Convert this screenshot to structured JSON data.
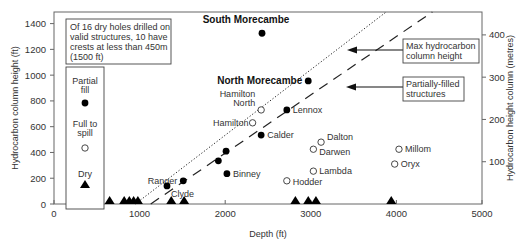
{
  "chart_data": {
    "type": "scatter",
    "title": "",
    "xlabel": "Depth (ft)",
    "ylabel": "Hydrocarbon column height (ft)",
    "ylabel_right": "Hydrocarbon height column (metres)",
    "xlim": [
      0,
      5000
    ],
    "ylim": [
      0,
      1490
    ],
    "x_ticks": [
      0,
      1000,
      2000,
      3000,
      4000,
      5000
    ],
    "y_ticks": [
      0,
      200,
      400,
      600,
      800,
      1000,
      1200,
      1400
    ],
    "y_ticks_right_m": [
      100,
      200,
      300,
      400
    ],
    "grid": false,
    "legend": {
      "position": "left-inset",
      "entries": [
        {
          "label_line1": "Partial",
          "label_line2": "fill",
          "marker": "filled-circle"
        },
        {
          "label_line1": "Full to",
          "label_line2": "spill",
          "marker": "open-circle"
        },
        {
          "label_line1": "Dry",
          "label_line2": "",
          "marker": "filled-triangle"
        }
      ]
    },
    "note_box": {
      "lines": [
        "Of 16 dry holes drilled on",
        "valid structures, 10 have",
        "crests at less than 450m",
        "(1500 ft)"
      ]
    },
    "annotations": [
      {
        "text_line1": "Max hydrocarbon",
        "text_line2": "column height",
        "points_to": "dotted-line"
      },
      {
        "text_line1": "Partially-filled",
        "text_line2": "structures",
        "points_to": "dashed-line"
      }
    ],
    "series": [
      {
        "name": "Partial fill",
        "marker": "filled-circle",
        "points": [
          {
            "label": "South Morecambe",
            "x": 2430,
            "y": 1325,
            "bold": true
          },
          {
            "label": "North Morecambe",
            "x": 2970,
            "y": 955,
            "bold": true
          },
          {
            "label": "Lennox",
            "x": 2720,
            "y": 730
          },
          {
            "label": "Calder",
            "x": 2420,
            "y": 535
          },
          {
            "label": "",
            "x": 2010,
            "y": 410
          },
          {
            "label": "",
            "x": 1920,
            "y": 335
          },
          {
            "label": "Binney",
            "x": 2020,
            "y": 235
          },
          {
            "label": "Ranger",
            "x": 1510,
            "y": 180
          },
          {
            "label": "Clyde",
            "x": 1320,
            "y": 140
          }
        ]
      },
      {
        "name": "Full to spill",
        "marker": "open-circle",
        "points": [
          {
            "label": "Hamilton North",
            "x": 2420,
            "y": 730
          },
          {
            "label": "Hamilton",
            "x": 2320,
            "y": 630
          },
          {
            "label": "Dalton",
            "x": 3120,
            "y": 480
          },
          {
            "label": "Darwen",
            "x": 3030,
            "y": 425
          },
          {
            "label": "Millom",
            "x": 4030,
            "y": 425
          },
          {
            "label": "Oryx",
            "x": 3980,
            "y": 310
          },
          {
            "label": "Lambda",
            "x": 3030,
            "y": 255
          },
          {
            "label": "Hodder",
            "x": 2720,
            "y": 180
          }
        ]
      },
      {
        "name": "Dry",
        "marker": "filled-triangle",
        "points": [
          {
            "x": 650,
            "y": 0
          },
          {
            "x": 820,
            "y": 0
          },
          {
            "x": 880,
            "y": 0
          },
          {
            "x": 930,
            "y": 0
          },
          {
            "x": 980,
            "y": 0
          },
          {
            "x": 1370,
            "y": 0
          },
          {
            "x": 1520,
            "y": 0
          },
          {
            "x": 2820,
            "y": 0
          },
          {
            "x": 2970,
            "y": 0
          },
          {
            "x": 3060,
            "y": 0
          },
          {
            "x": 3940,
            "y": 0
          }
        ]
      }
    ],
    "lines": [
      {
        "name": "Max hydrocarbon column height",
        "style": "dotted",
        "from": [
          950,
          0
        ],
        "to": [
          3880,
          1490
        ]
      },
      {
        "name": "Partially-filled structures",
        "style": "dashed",
        "from": [
          1130,
          0
        ],
        "to": [
          4420,
          1490
        ]
      }
    ]
  }
}
